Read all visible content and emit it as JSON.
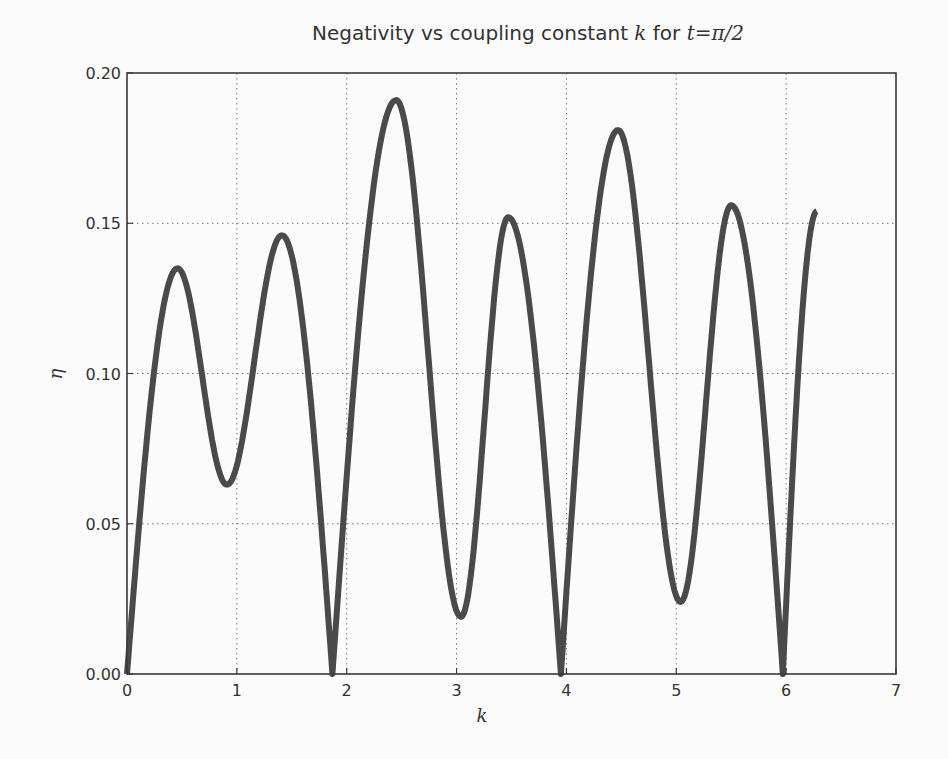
{
  "chart_data": {
    "type": "line",
    "title": "Negativity vs coupling constant k for t=π/2",
    "title_parts": {
      "prefix": "Negativity vs coupling constant ",
      "var": "k",
      "middle": " for ",
      "expr": "t=π/2"
    },
    "xlabel": "k",
    "ylabel": "η",
    "xlim": [
      0,
      7
    ],
    "ylim": [
      0,
      0.2
    ],
    "xticks": [
      0,
      1,
      2,
      3,
      4,
      5,
      6,
      7
    ],
    "xtick_labels": [
      "0",
      "1",
      "2",
      "3",
      "4",
      "5",
      "6",
      "7"
    ],
    "yticks": [
      0.0,
      0.05,
      0.1,
      0.15,
      0.2
    ],
    "ytick_labels": [
      "0.00",
      "0.05",
      "0.10",
      "0.15",
      "0.20"
    ],
    "grid": true,
    "legend": null,
    "line_color": "#4a4a4a",
    "series": [
      {
        "name": "negativity",
        "x": [
          0.0,
          0.46,
          0.91,
          1.41,
          1.87,
          2.45,
          3.04,
          3.47,
          3.95,
          4.47,
          5.04,
          5.5,
          5.97,
          6.28
        ],
        "y": [
          0.0,
          0.135,
          0.063,
          0.146,
          0.0,
          0.191,
          0.019,
          0.152,
          0.0,
          0.181,
          0.024,
          0.156,
          0.0,
          0.154
        ],
        "point_kind": [
          "zero",
          "max",
          "min",
          "max",
          "zero",
          "max",
          "min",
          "max",
          "zero",
          "max",
          "min",
          "max",
          "zero",
          "end"
        ]
      }
    ]
  }
}
